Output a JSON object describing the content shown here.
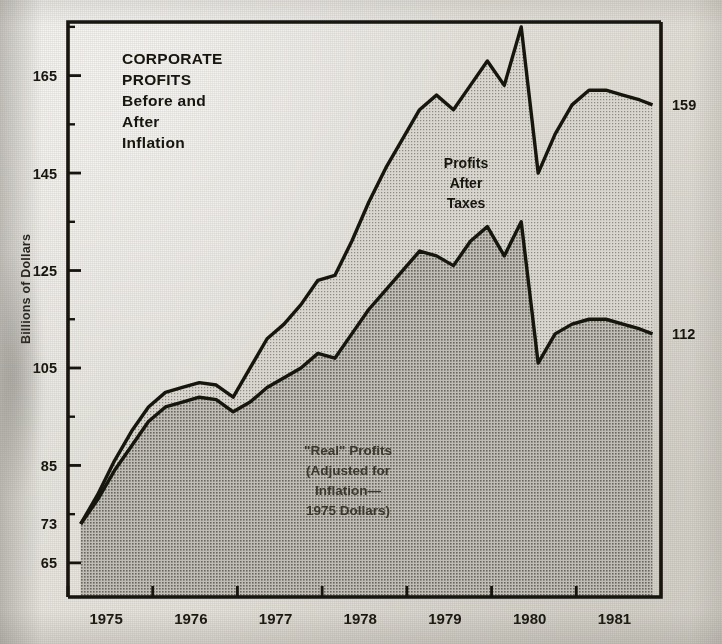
{
  "title": {
    "lines": [
      "CORPORATE",
      "PROFITS",
      "Before and",
      "After",
      "Inflation"
    ]
  },
  "axes": {
    "ylabel": "Billions of Dollars",
    "yticks": [
      165,
      145,
      125,
      105,
      85,
      65
    ],
    "ytick_labels": [
      "165",
      "145",
      "125",
      "105",
      "85",
      "65"
    ],
    "ylim": [
      58,
      176
    ],
    "xticks": [
      1975,
      1976,
      1977,
      1978,
      1979,
      1980,
      1981
    ],
    "xtick_labels": [
      "1975",
      "1976",
      "1977",
      "1978",
      "1979",
      "1980",
      "1981"
    ],
    "xlim": [
      1974.75,
      1981.75
    ]
  },
  "edge_labels": {
    "start_value": "73",
    "end_upper": "159",
    "end_lower": "112"
  },
  "annotations": {
    "upper_series": [
      "Profits",
      "After",
      "Taxes"
    ],
    "lower_series": [
      "\"Real\" Profits",
      "(Adjusted for",
      "Inflation—",
      "1975 Dollars)"
    ]
  },
  "colors": {
    "ink": "#16140e",
    "paper": "#e8e6e1",
    "upper_fill": "#c9c7c0",
    "lower_fill": "#a9a7a0"
  },
  "chart_data": {
    "type": "area",
    "subtitle": "",
    "xlabel": "",
    "ylabel": "Billions of Dollars",
    "ylim": [
      58,
      176
    ],
    "xlim": [
      1974.75,
      1981.75
    ],
    "grid": false,
    "legend": "inline annotations",
    "stacked": false,
    "x": [
      1974.9,
      1975.1,
      1975.3,
      1975.5,
      1975.7,
      1975.9,
      1976.1,
      1976.3,
      1976.5,
      1976.7,
      1976.9,
      1977.1,
      1977.3,
      1977.5,
      1977.7,
      1977.9,
      1978.1,
      1978.3,
      1978.5,
      1978.7,
      1978.9,
      1979.1,
      1979.3,
      1979.5,
      1979.7,
      1979.9,
      1980.1,
      1980.3,
      1980.5,
      1980.7,
      1980.9,
      1981.1,
      1981.3,
      1981.5,
      1981.65
    ],
    "series": [
      {
        "name": "Profits After Taxes",
        "annotation": "Profits After Taxes",
        "start_value": 73,
        "end_value": 159,
        "values": [
          73,
          79,
          86,
          92,
          97,
          100,
          101,
          102,
          101.5,
          99,
          105,
          111,
          114,
          118,
          123,
          124,
          131,
          139,
          146,
          152,
          158,
          161,
          158,
          163,
          168,
          163,
          175,
          145,
          153,
          159,
          162,
          162,
          161,
          160,
          159
        ]
      },
      {
        "name": "\"Real\" Profits (Adjusted for Inflation — 1975 Dollars)",
        "annotation": "\"Real\" Profits (Adjusted for Inflation— 1975 Dollars)",
        "start_value": 73,
        "end_value": 112,
        "values": [
          73,
          78,
          84,
          89,
          94,
          97,
          98,
          99,
          98.5,
          96,
          98,
          101,
          103,
          105,
          108,
          107,
          112,
          117,
          121,
          125,
          129,
          128,
          126,
          131,
          134,
          128,
          135,
          106,
          112,
          114,
          115,
          115,
          114,
          113,
          112
        ]
      }
    ]
  }
}
